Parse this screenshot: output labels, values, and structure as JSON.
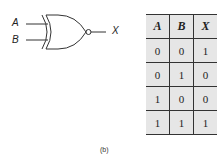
{
  "gate": {
    "type": "XNOR",
    "inputs": [
      "A",
      "B"
    ],
    "output": "X"
  },
  "truth_table": {
    "headers": [
      "A",
      "B",
      "X"
    ],
    "rows": [
      [
        "0",
        "0",
        "1"
      ],
      [
        "0",
        "1",
        "0"
      ],
      [
        "1",
        "0",
        "0"
      ],
      [
        "1",
        "1",
        "1"
      ]
    ]
  },
  "caption": "(b)"
}
